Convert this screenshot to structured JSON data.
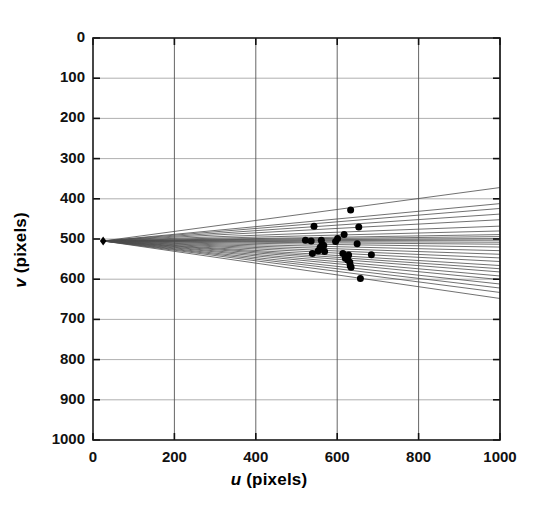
{
  "chart_data": {
    "type": "scatter",
    "title": "",
    "subtitle": "",
    "xlabel": "u (pixels)",
    "xlabel_var": "u",
    "xlabel_unit": "(pixels)",
    "ylabel": "v (pixels)",
    "ylabel_var": "v",
    "ylabel_unit": "(pixels)",
    "xlim": [
      0,
      1000
    ],
    "ylim": [
      0,
      1000
    ],
    "y_inverted": true,
    "grid": true,
    "grid_color": "#9a9a9a",
    "legend": null,
    "legend_position": "none",
    "xticks": [
      0,
      200,
      400,
      600,
      800,
      1000
    ],
    "yticks": [
      0,
      100,
      200,
      300,
      400,
      500,
      600,
      700,
      800,
      900,
      1000
    ],
    "xtick_labels": [
      "0",
      "200",
      "400",
      "600",
      "800",
      "1000"
    ],
    "ytick_labels": [
      "0",
      "100",
      "200",
      "300",
      "400",
      "500",
      "600",
      "700",
      "800",
      "900",
      "1000"
    ],
    "series": [
      {
        "name": "vanishing point",
        "type": "scatter",
        "marker": "diamond",
        "color": "#000000",
        "size": 9,
        "points": [
          {
            "u": 25,
            "v": 505
          }
        ]
      },
      {
        "name": "image line segments",
        "type": "line",
        "color": "#4d4d4d",
        "width": 0.8,
        "description": "straight lines radiating from the vanishing point to the right edge of the image",
        "lines": [
          {
            "from": {
              "u": 25,
              "v": 505
            },
            "to": {
              "u": 1000,
              "v": 372
            }
          },
          {
            "from": {
              "u": 25,
              "v": 505
            },
            "to": {
              "u": 1000,
              "v": 412
            }
          },
          {
            "from": {
              "u": 25,
              "v": 505
            },
            "to": {
              "u": 1000,
              "v": 424
            }
          },
          {
            "from": {
              "u": 25,
              "v": 505
            },
            "to": {
              "u": 1000,
              "v": 438
            }
          },
          {
            "from": {
              "u": 25,
              "v": 505
            },
            "to": {
              "u": 1000,
              "v": 452
            }
          },
          {
            "from": {
              "u": 25,
              "v": 505
            },
            "to": {
              "u": 1000,
              "v": 468
            }
          },
          {
            "from": {
              "u": 25,
              "v": 505
            },
            "to": {
              "u": 1000,
              "v": 480
            }
          },
          {
            "from": {
              "u": 25,
              "v": 505
            },
            "to": {
              "u": 1000,
              "v": 489
            }
          },
          {
            "from": {
              "u": 25,
              "v": 505
            },
            "to": {
              "u": 1000,
              "v": 494
            }
          },
          {
            "from": {
              "u": 25,
              "v": 505
            },
            "to": {
              "u": 1000,
              "v": 499
            }
          },
          {
            "from": {
              "u": 25,
              "v": 505
            },
            "to": {
              "u": 1000,
              "v": 503
            }
          },
          {
            "from": {
              "u": 25,
              "v": 505
            },
            "to": {
              "u": 1000,
              "v": 508
            }
          },
          {
            "from": {
              "u": 25,
              "v": 505
            },
            "to": {
              "u": 1000,
              "v": 513
            }
          },
          {
            "from": {
              "u": 25,
              "v": 505
            },
            "to": {
              "u": 1000,
              "v": 520
            }
          },
          {
            "from": {
              "u": 25,
              "v": 505
            },
            "to": {
              "u": 1000,
              "v": 529
            }
          },
          {
            "from": {
              "u": 25,
              "v": 505
            },
            "to": {
              "u": 1000,
              "v": 538
            }
          },
          {
            "from": {
              "u": 25,
              "v": 505
            },
            "to": {
              "u": 1000,
              "v": 547
            }
          },
          {
            "from": {
              "u": 25,
              "v": 505
            },
            "to": {
              "u": 1000,
              "v": 556
            }
          },
          {
            "from": {
              "u": 25,
              "v": 505
            },
            "to": {
              "u": 1000,
              "v": 566
            }
          },
          {
            "from": {
              "u": 25,
              "v": 505
            },
            "to": {
              "u": 1000,
              "v": 574
            }
          },
          {
            "from": {
              "u": 25,
              "v": 505
            },
            "to": {
              "u": 1000,
              "v": 582
            }
          },
          {
            "from": {
              "u": 25,
              "v": 505
            },
            "to": {
              "u": 1000,
              "v": 592
            }
          },
          {
            "from": {
              "u": 25,
              "v": 505
            },
            "to": {
              "u": 1000,
              "v": 601
            }
          },
          {
            "from": {
              "u": 25,
              "v": 505
            },
            "to": {
              "u": 1000,
              "v": 612
            }
          },
          {
            "from": {
              "u": 25,
              "v": 505
            },
            "to": {
              "u": 1000,
              "v": 622
            }
          },
          {
            "from": {
              "u": 25,
              "v": 505
            },
            "to": {
              "u": 1000,
              "v": 633
            }
          },
          {
            "from": {
              "u": 25,
              "v": 505
            },
            "to": {
              "u": 1000,
              "v": 648
            }
          }
        ]
      },
      {
        "name": "feature points",
        "type": "scatter",
        "marker": "circle",
        "color": "#000000",
        "size": 7,
        "points": [
          {
            "u": 633,
            "v": 428
          },
          {
            "u": 543,
            "v": 468
          },
          {
            "u": 653,
            "v": 470
          },
          {
            "u": 617,
            "v": 489
          },
          {
            "u": 522,
            "v": 503
          },
          {
            "u": 536,
            "v": 505
          },
          {
            "u": 561,
            "v": 503
          },
          {
            "u": 601,
            "v": 499
          },
          {
            "u": 596,
            "v": 506
          },
          {
            "u": 563,
            "v": 513
          },
          {
            "u": 567,
            "v": 516
          },
          {
            "u": 558,
            "v": 521
          },
          {
            "u": 649,
            "v": 512
          },
          {
            "u": 553,
            "v": 530
          },
          {
            "u": 569,
            "v": 531
          },
          {
            "u": 539,
            "v": 536
          },
          {
            "u": 614,
            "v": 536
          },
          {
            "u": 628,
            "v": 540
          },
          {
            "u": 684,
            "v": 539
          },
          {
            "u": 620,
            "v": 548
          },
          {
            "u": 626,
            "v": 552
          },
          {
            "u": 631,
            "v": 558
          },
          {
            "u": 632,
            "v": 566
          },
          {
            "u": 634,
            "v": 570
          },
          {
            "u": 657,
            "v": 598
          }
        ]
      }
    ]
  },
  "axes": {
    "x_label_text": "u (pixels)",
    "y_label_text": "v (pixels)"
  }
}
